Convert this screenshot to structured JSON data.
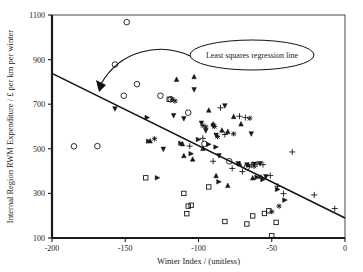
{
  "chart_data": {
    "type": "scatter",
    "title": "",
    "xlabel": "Winter Index / (unitless)",
    "ylabel": "Internal Region RWM Expenditure / £ per km per winter",
    "xlim": [
      -200,
      0
    ],
    "ylim": [
      100,
      1100
    ],
    "xticks": [
      -200,
      -150,
      -100,
      -50,
      0
    ],
    "xtick_labels": [
      "-200",
      "-150",
      "-100",
      "-50",
      "0"
    ],
    "yticks": [
      100,
      300,
      500,
      700,
      900,
      1100
    ],
    "ytick_labels": [
      "100",
      "300",
      "500",
      "700",
      "900",
      "1100"
    ],
    "grid": false,
    "legend": "none",
    "annotations": [
      {
        "text": "Least squares regression line",
        "shape": "ellipse",
        "points_to": "regression-line"
      }
    ],
    "trendline": {
      "name": "Least squares regression line",
      "type": "linear",
      "x_start": -200,
      "y_start": 840,
      "x_end": 0,
      "y_end": 190
    },
    "series": [
      {
        "name": "open-circle",
        "marker": "circle-open",
        "points": [
          [
            -149,
            1068
          ],
          [
            -157,
            878
          ],
          [
            -151,
            738
          ],
          [
            -142,
            790
          ],
          [
            -126,
            738
          ],
          [
            -119,
            722
          ],
          [
            -185,
            511
          ],
          [
            -169,
            512
          ],
          [
            -107,
            662
          ],
          [
            -96,
            522
          ],
          [
            -79,
            444
          ],
          [
            -67,
            418
          ]
        ]
      },
      {
        "name": "triangle-down",
        "marker": "triangle-down",
        "points": [
          [
            -157,
            676
          ],
          [
            -124,
            495
          ],
          [
            -117,
            646
          ],
          [
            -110,
            632
          ],
          [
            -103,
            762
          ],
          [
            -98,
            612
          ],
          [
            -95,
            578
          ],
          [
            -90,
            600
          ],
          [
            -86,
            466
          ],
          [
            -82,
            690
          ],
          [
            -73,
            430
          ],
          [
            -67,
            425
          ],
          [
            -62,
            428
          ],
          [
            -58,
            430
          ],
          [
            -54,
            372
          ],
          [
            -64,
            564
          ],
          [
            -88,
            558
          ]
        ]
      },
      {
        "name": "triangle-up",
        "marker": "triangle-up",
        "points": [
          [
            -115,
            810
          ],
          [
            -103,
            822
          ],
          [
            -93,
            672
          ],
          [
            -110,
            468
          ],
          [
            -104,
            452
          ],
          [
            -90,
            610
          ],
          [
            -84,
            582
          ],
          [
            -80,
            576
          ],
          [
            -76,
            643
          ],
          [
            -71,
            610
          ],
          [
            -72,
            432
          ],
          [
            -66,
            426
          ],
          [
            -133,
            534
          ],
          [
            -111,
            521
          ],
          [
            -97,
            500
          ],
          [
            -88,
            378
          ],
          [
            -80,
            334
          ],
          [
            -63,
            368
          ]
        ]
      },
      {
        "name": "plus",
        "marker": "plus",
        "points": [
          [
            -106,
            512
          ],
          [
            -97,
            547
          ],
          [
            -85,
            684
          ],
          [
            -82,
            564
          ],
          [
            -72,
            646
          ],
          [
            -68,
            640
          ],
          [
            -64,
            428
          ],
          [
            -60,
            432
          ],
          [
            -56,
            429
          ],
          [
            -51,
            380
          ],
          [
            -46,
            332
          ],
          [
            -42,
            299
          ],
          [
            -36,
            486
          ],
          [
            -21,
            293
          ],
          [
            -7,
            232
          ],
          [
            -77,
            412
          ],
          [
            -70,
            398
          ],
          [
            -90,
            444
          ]
        ]
      },
      {
        "name": "triangle-right",
        "marker": "triangle-right",
        "points": [
          [
            -135,
            640
          ],
          [
            -128,
            370
          ],
          [
            -112,
            525
          ],
          [
            -105,
            478
          ],
          [
            -100,
            542
          ],
          [
            -93,
            520
          ],
          [
            -86,
            352
          ],
          [
            -88,
            508
          ],
          [
            -56,
            362
          ],
          [
            -46,
            318
          ],
          [
            -41,
            270
          ],
          [
            -134,
            534
          ],
          [
            -60,
            372
          ]
        ]
      },
      {
        "name": "square-open",
        "marker": "square-open",
        "points": [
          [
            -136,
            370
          ],
          [
            -110,
            300
          ],
          [
            -107,
            243
          ],
          [
            -105,
            247
          ],
          [
            -108,
            209
          ],
          [
            -93,
            329
          ],
          [
            -82,
            174
          ],
          [
            -67,
            163
          ],
          [
            -63,
            199
          ],
          [
            -55,
            210
          ],
          [
            -50,
            110
          ],
          [
            -47,
            170
          ],
          [
            -52,
            222
          ],
          [
            -120,
            722
          ]
        ]
      },
      {
        "name": "star-x",
        "marker": "star",
        "points": [
          [
            -130,
            545
          ],
          [
            -118,
            722
          ],
          [
            -116,
            714
          ],
          [
            -97,
            604
          ],
          [
            -95,
            598
          ],
          [
            -89,
            600
          ],
          [
            -76,
            567
          ],
          [
            -65,
            637
          ],
          [
            -45,
            243
          ],
          [
            -50,
            218
          ],
          [
            -58,
            374
          ],
          [
            -62,
            422
          ],
          [
            -87,
            555
          ]
        ]
      }
    ]
  }
}
